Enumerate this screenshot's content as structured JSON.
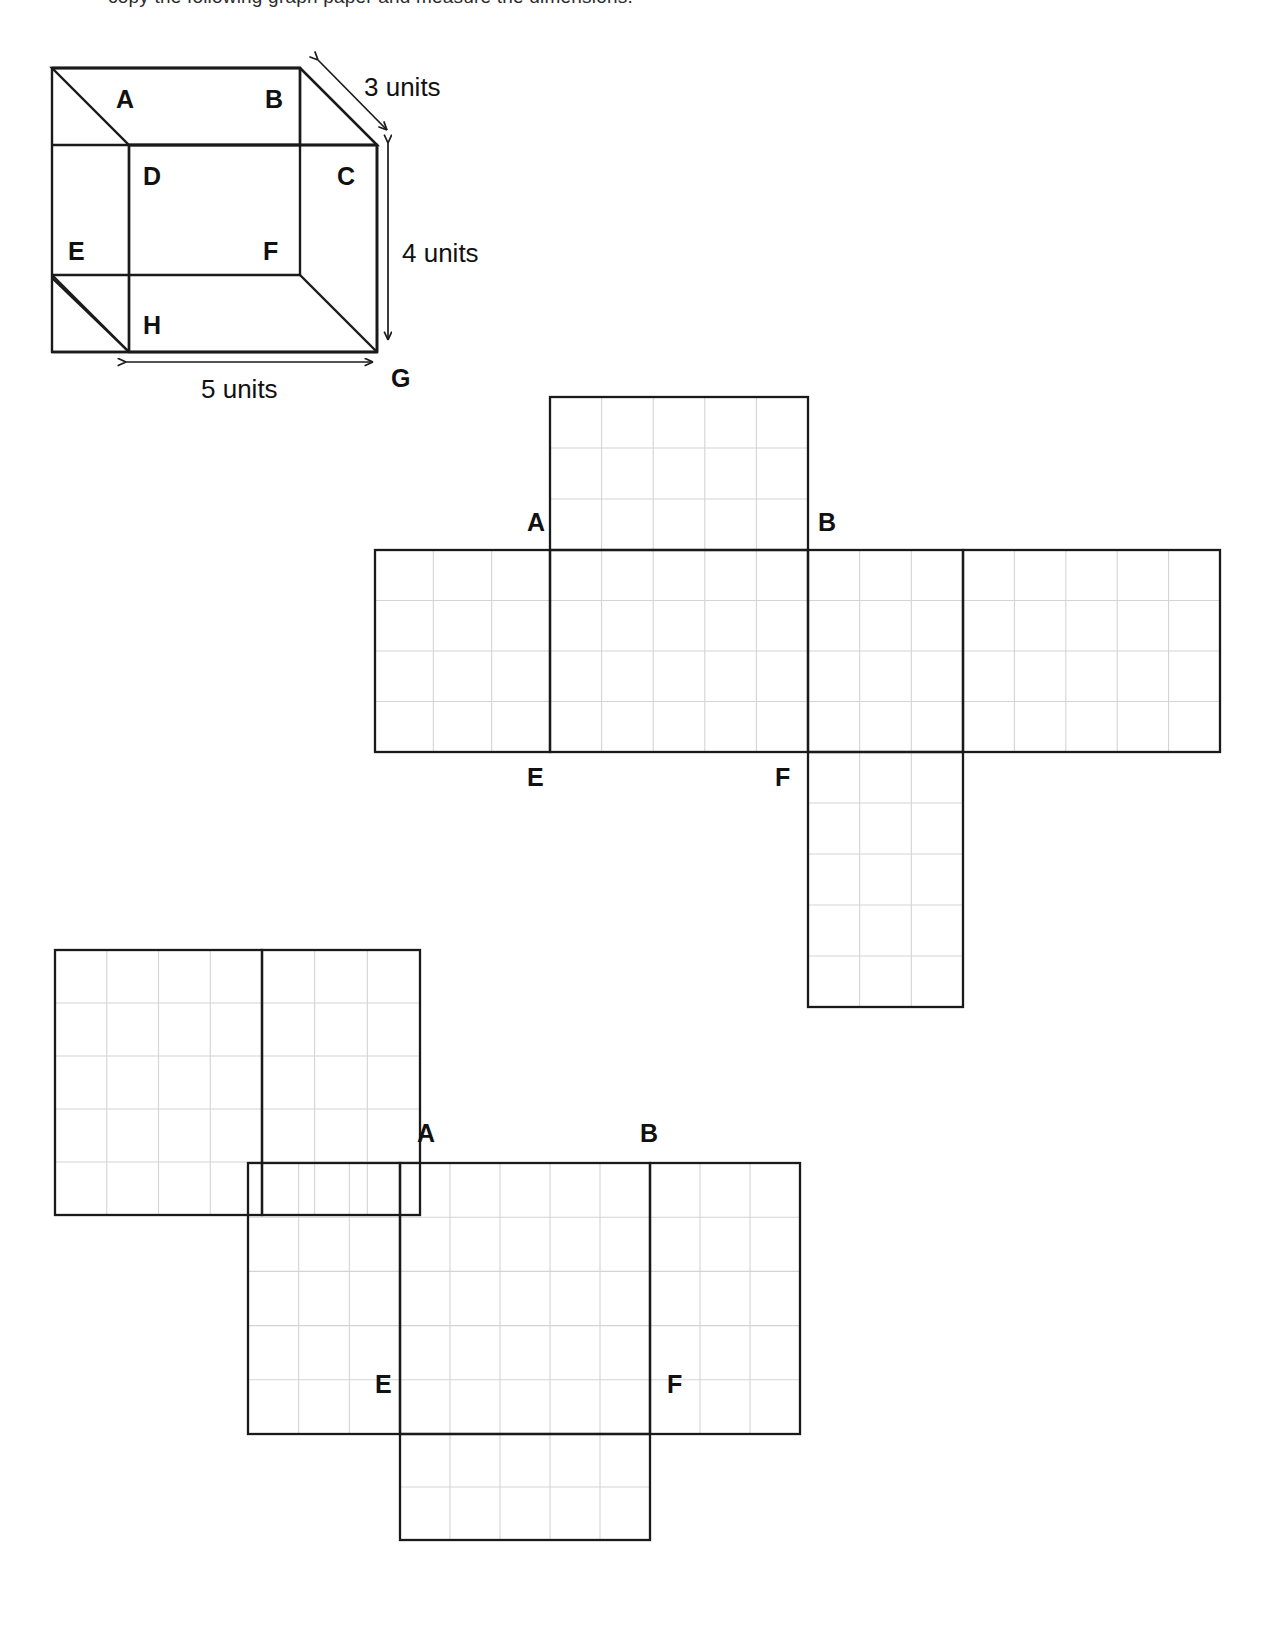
{
  "page": {
    "background_color": "#ffffff",
    "ink_color": "#1a1a1a",
    "grid_color": "#d4d4d4",
    "truncated_top_line": "copy the following graph paper and measure the dimensions."
  },
  "cube_figure": {
    "name": "rectangular-prism",
    "vertex_labels": [
      "A",
      "B",
      "C",
      "D",
      "E",
      "F",
      "G",
      "H"
    ],
    "dimensions": [
      {
        "id": "depth",
        "value": "3 units",
        "label": "3 units"
      },
      {
        "id": "height",
        "value": "4 units",
        "label": "4 units"
      },
      {
        "id": "width",
        "value": "5 units",
        "label": "5 units"
      }
    ]
  },
  "net_one": {
    "name": "net-diagram-one",
    "labels": [
      {
        "text": "A",
        "x": 527,
        "y": 531
      },
      {
        "text": "B",
        "x": 818,
        "y": 531
      },
      {
        "text": "E",
        "x": 527,
        "y": 786
      },
      {
        "text": "F",
        "x": 775,
        "y": 786
      }
    ],
    "faces": [
      {
        "name": "top-flap",
        "x": 550,
        "y": 397,
        "w": 258,
        "h": 153,
        "cols": 5,
        "rows": 3
      },
      {
        "name": "left-face",
        "x": 375,
        "y": 550,
        "w": 175,
        "h": 202,
        "cols": 3,
        "rows": 4
      },
      {
        "name": "front-face",
        "x": 550,
        "y": 550,
        "w": 258,
        "h": 202,
        "cols": 5,
        "rows": 4
      },
      {
        "name": "right-face",
        "x": 808,
        "y": 550,
        "w": 155,
        "h": 202,
        "cols": 3,
        "rows": 4
      },
      {
        "name": "back-face",
        "x": 963,
        "y": 550,
        "w": 257,
        "h": 202,
        "cols": 5,
        "rows": 4
      },
      {
        "name": "bottom-flap",
        "x": 808,
        "y": 752,
        "w": 155,
        "h": 255,
        "cols": 3,
        "rows": 5
      }
    ]
  },
  "net_two": {
    "name": "net-diagram-two",
    "labels": [
      {
        "text": "A",
        "x": 417,
        "y": 1142
      },
      {
        "text": "B",
        "x": 640,
        "y": 1142
      },
      {
        "text": "E",
        "x": 375,
        "y": 1393
      },
      {
        "text": "F",
        "x": 667,
        "y": 1393
      }
    ],
    "faces": [
      {
        "name": "upper-left-face",
        "x": 55,
        "y": 950,
        "w": 207,
        "h": 265,
        "cols": 4,
        "rows": 5
      },
      {
        "name": "upper-right-face",
        "x": 262,
        "y": 950,
        "w": 158,
        "h": 265,
        "cols": 3,
        "rows": 5
      },
      {
        "name": "mid-left-face",
        "x": 248,
        "y": 1163,
        "w": 152,
        "h": 271,
        "cols": 3,
        "rows": 5
      },
      {
        "name": "mid-center-face",
        "x": 400,
        "y": 1163,
        "w": 250,
        "h": 271,
        "cols": 5,
        "rows": 5
      },
      {
        "name": "mid-right-face",
        "x": 650,
        "y": 1163,
        "w": 150,
        "h": 271,
        "cols": 3,
        "rows": 5
      },
      {
        "name": "bottom-flap",
        "x": 400,
        "y": 1434,
        "w": 250,
        "h": 106,
        "cols": 5,
        "rows": 2
      }
    ]
  },
  "chart_data": {
    "type": "diagram",
    "prism_dimensions": {
      "width": 5,
      "height": 4,
      "depth": 3,
      "unit": "units"
    },
    "surface_area": 94,
    "volume": 60
  }
}
